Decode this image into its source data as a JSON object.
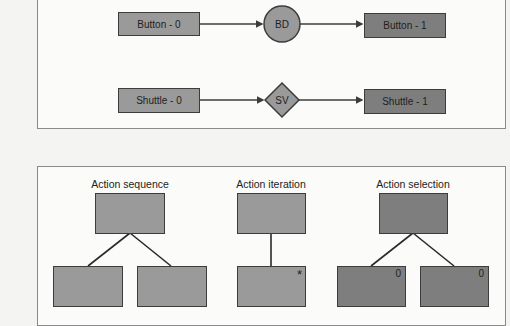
{
  "top_panel": {
    "rows": [
      {
        "source": {
          "label": "Button - 0"
        },
        "operator": {
          "label": "BD",
          "shape": "circle"
        },
        "target": {
          "label": "Button - 1"
        }
      },
      {
        "source": {
          "label": "Shuttle - 0"
        },
        "operator": {
          "label": "SV",
          "shape": "diamond"
        },
        "target": {
          "label": "Shuttle - 1"
        }
      }
    ]
  },
  "bottom_panel": {
    "trees": [
      {
        "title": "Action sequence",
        "children": [
          {
            "mark": ""
          },
          {
            "mark": ""
          }
        ]
      },
      {
        "title": "Action iteration",
        "children": [
          {
            "mark": "*"
          }
        ]
      },
      {
        "title": "Action selection",
        "children": [
          {
            "mark": "0"
          },
          {
            "mark": "0"
          }
        ]
      }
    ]
  },
  "colors": {
    "box_fill": "#9a9a9a",
    "box_fill_dark": "#7e7e7e",
    "stroke": "#3c3c3c",
    "panel_border": "#8a8a8a",
    "background": "#f4f4f2"
  }
}
